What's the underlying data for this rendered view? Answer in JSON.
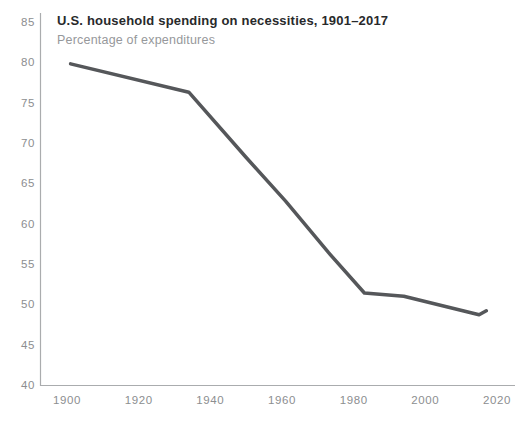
{
  "header": {
    "title": "U.S. household spending on necessities, 1901–2017",
    "subtitle": "Percentage of expenditures"
  },
  "colors": {
    "background": "#ffffff",
    "line": "#55575a",
    "axis": "#aaacae",
    "tick_label": "#8c8e90",
    "title": "#28292b",
    "subtitle": "#96989b"
  },
  "chart_data": {
    "type": "line",
    "title": "U.S. household spending on necessities, 1901–2017",
    "subtitle": "Percentage of expenditures",
    "xlabel": "",
    "ylabel": "",
    "xlim": [
      1900,
      2020
    ],
    "ylim": [
      40,
      85
    ],
    "x_ticks": [
      1900,
      1920,
      1940,
      1960,
      1980,
      2000,
      2020
    ],
    "y_ticks": [
      85,
      80,
      75,
      70,
      65,
      60,
      55,
      50,
      45,
      40
    ],
    "grid": false,
    "legend": false,
    "series": [
      {
        "name": "Share of household expenditures spent on food, clothing and housing",
        "points": [
          {
            "year": 1901,
            "value": 79.8
          },
          {
            "year": 1934,
            "value": 76.3
          },
          {
            "year": 1950,
            "value": 68.2
          },
          {
            "year": 1961,
            "value": 62.8
          },
          {
            "year": 1973,
            "value": 56.4
          },
          {
            "year": 1983,
            "value": 51.4
          },
          {
            "year": 1994,
            "value": 51.0
          },
          {
            "year": 2015,
            "value": 48.7
          },
          {
            "year": 2017,
            "value": 49.2
          }
        ]
      }
    ]
  }
}
